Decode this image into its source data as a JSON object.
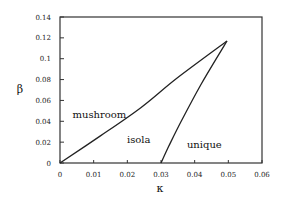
{
  "chart_data": {
    "type": "line",
    "title": "",
    "xlabel": "κ",
    "ylabel": "β",
    "xlim": [
      0,
      0.06
    ],
    "ylim": [
      0,
      0.14
    ],
    "grid": false,
    "legend": null,
    "x_ticks": [
      "0",
      "0.01",
      "0.02",
      "0.03",
      "0.04",
      "0.05",
      "0.06"
    ],
    "y_ticks": [
      "0",
      "0.02",
      "0.04",
      "0.06",
      "0.08",
      "0.1",
      "0.12",
      "0.14"
    ],
    "series": [
      {
        "name": "mushroom-isola boundary",
        "points": [
          [
            0,
            0
          ],
          [
            0.012,
            0.026
          ],
          [
            0.024,
            0.053
          ],
          [
            0.0346,
            0.081
          ],
          [
            0.0496,
            0.117
          ]
        ]
      },
      {
        "name": "isola-unique boundary",
        "points": [
          [
            0.03,
            0
          ],
          [
            0.0323,
            0.016
          ],
          [
            0.036,
            0.04
          ],
          [
            0.042,
            0.076
          ],
          [
            0.0496,
            0.117
          ]
        ]
      }
    ],
    "annotations": [
      {
        "text": "mushroom",
        "x": 0.0037,
        "y": 0.043
      },
      {
        "text": "isola",
        "x": 0.0199,
        "y": 0.019
      },
      {
        "text": "unique",
        "x": 0.0377,
        "y": 0.014
      }
    ]
  }
}
